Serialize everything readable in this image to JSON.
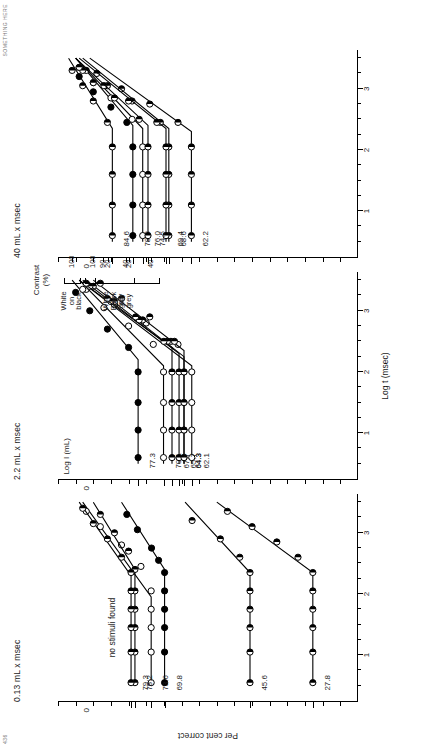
{
  "page": {
    "header_left": "436",
    "header_right": "SOMETHING HERE"
  },
  "figure": {
    "y_axis_title": "Per cent correct",
    "x_axis_title": "Log t (msec)",
    "contrast_axis_title_line1": "Contrast",
    "contrast_axis_title_line2": "(%)",
    "note_no_stimuli": "no stimuli found",
    "x_tick_labels": [
      "1",
      "2",
      "3"
    ],
    "y_tick_labels": [
      "0"
    ],
    "contrast_groups": [
      {
        "label_lines": [
          "Black",
          "on",
          "grey"
        ],
        "ticks": [
          "100",
          "40",
          "20"
        ]
      },
      {
        "label_lines": [
          "White",
          "on",
          "grey"
        ],
        "ticks": [
          "90",
          "40",
          "20"
        ]
      },
      {
        "label_lines": [
          "White",
          "on",
          "black"
        ],
        "ticks": [
          "100"
        ]
      }
    ],
    "panels": [
      {
        "title": "0.13 mL x msec",
        "y_axis_label_text": "Log I (mL)",
        "show_y_axis_title": true,
        "series": [
          {
            "value_label": "69.8",
            "marker": "filled",
            "contrast_group": "black-on-grey",
            "contrast": 100
          },
          {
            "value_label": "45.6",
            "marker": "half",
            "contrast_group": "black-on-grey",
            "contrast": 40
          },
          {
            "value_label": "27.8",
            "marker": "half",
            "contrast_group": "black-on-grey",
            "contrast": 20
          },
          {
            "value_label": "73.6",
            "marker": "open",
            "contrast_group": "white-on-grey",
            "contrast": 90
          },
          {
            "value_label": "78.2",
            "marker": "half",
            "contrast_group": "white-on-grey",
            "contrast": 40
          },
          {
            "value_label": "",
            "marker": "none",
            "contrast_group": "white-on-grey",
            "contrast": 20
          },
          {
            "value_label": "79.3",
            "marker": "half",
            "contrast_group": "white-on-black",
            "contrast": 100
          }
        ]
      },
      {
        "title": "2.2 mL x msec",
        "y_axis_label_text": "Log I (mL)",
        "show_y_axis_title": false,
        "series": [
          {
            "value_label": "77.3",
            "marker": "filled",
            "contrast_group": "black-on-grey",
            "contrast": 100
          },
          {
            "value_label": "62.1",
            "marker": "open",
            "contrast_group": "black-on-grey",
            "contrast": 40
          },
          {
            "value_label": "64.3",
            "marker": "half",
            "contrast_group": "black-on-grey",
            "contrast": 20
          },
          {
            "value_label": "70.1",
            "marker": "open",
            "contrast_group": "white-on-grey",
            "contrast": 90
          },
          {
            "value_label": "65.7",
            "marker": "half",
            "contrast_group": "white-on-grey",
            "contrast": 40
          },
          {
            "value_label": "64.3",
            "marker": "half",
            "contrast_group": "white-on-grey",
            "contrast": 20
          },
          {
            "value_label": "67.7",
            "marker": "half",
            "contrast_group": "white-on-black",
            "contrast": 100
          }
        ]
      },
      {
        "title": "40 mL x msec",
        "y_axis_label_text": "Log I (mL)",
        "show_y_axis_title": false,
        "series": [
          {
            "value_label": "78.8",
            "marker": "filled",
            "contrast_group": "black-on-grey",
            "contrast": 100
          },
          {
            "value_label": "62.2",
            "marker": "half",
            "contrast_group": "black-on-grey",
            "contrast": 40
          },
          {
            "value_label": "68.6",
            "marker": "half",
            "contrast_group": "black-on-grey",
            "contrast": 20
          },
          {
            "value_label": "76.0",
            "marker": "open",
            "contrast_group": "white-on-grey",
            "contrast": 90
          },
          {
            "value_label": "69.4",
            "marker": "half",
            "contrast_group": "white-on-grey",
            "contrast": 40
          },
          {
            "value_label": "74.5",
            "marker": "half",
            "contrast_group": "white-on-grey",
            "contrast": 20
          },
          {
            "value_label": "84.6",
            "marker": "half",
            "contrast_group": "white-on-black",
            "contrast": 100
          }
        ]
      }
    ]
  },
  "chart_data": {
    "type": "scatter",
    "xlabel": "Log t (msec)",
    "ylabel": "Per cent correct",
    "secondary_ylabel": "Contrast (%)",
    "xlim": [
      0.3,
      3.6
    ],
    "grid": false,
    "legend": "none",
    "panels": [
      {
        "name": "0.13 mL x msec",
        "series": [
          {
            "name": "Black on grey 100% (69.8)",
            "marker": "filled",
            "x": [
              0.55,
              1.05,
              1.45,
              1.75,
              2.05,
              2.35,
              2.55,
              2.75,
              3.05,
              3.3
            ],
            "y": [
              69.8,
              69.8,
              69.8,
              69.8,
              69.8,
              69.8,
              71.5,
              73.5,
              77.5,
              80.5
            ],
            "fit": {
              "breakpoint_x": 2.4,
              "plateau_y": 69.8,
              "slope_end_y": 82.0
            }
          },
          {
            "name": "Black on grey 40% (45.6)",
            "marker": "half",
            "x": [
              0.55,
              1.05,
              1.45,
              1.75,
              2.05,
              2.35,
              2.6,
              2.9,
              3.2
            ],
            "y": [
              45.6,
              45.6,
              45.6,
              45.6,
              45.6,
              45.6,
              48.5,
              54.0,
              62.0
            ],
            "fit": {
              "breakpoint_x": 2.35,
              "plateau_y": 45.6,
              "slope_end_y": 64.0
            }
          },
          {
            "name": "Black on grey 20% (27.8)",
            "marker": "half",
            "x": [
              0.55,
              1.05,
              1.45,
              1.75,
              2.05,
              2.35,
              2.6,
              2.85,
              3.1,
              3.35
            ],
            "y": [
              27.8,
              27.8,
              27.8,
              27.8,
              27.8,
              27.8,
              32.0,
              38.0,
              45.0,
              52.0
            ],
            "fit": {
              "breakpoint_x": 2.35,
              "plateau_y": 27.8,
              "slope_end_y": 55.0
            }
          },
          {
            "name": "White on grey 90% (73.6)",
            "marker": "open",
            "x": [
              0.55,
              1.05,
              1.45,
              1.75,
              2.05,
              2.45,
              2.8,
              3.1,
              3.35
            ],
            "y": [
              73.6,
              73.6,
              73.6,
              73.6,
              73.6,
              76.5,
              82.0,
              88.0,
              92.0
            ],
            "fit": {
              "breakpoint_x": 1.95,
              "plateau_y": 73.6,
              "slope_end_y": 93.0
            }
          },
          {
            "name": "White on grey 40% (78.2)",
            "marker": "half",
            "x": [
              0.55,
              1.05,
              1.45,
              1.75,
              2.05,
              2.4,
              2.7,
              3.0,
              3.3
            ],
            "y": [
              78.2,
              78.2,
              78.2,
              78.2,
              78.2,
              78.2,
              80.0,
              84.0,
              88.0
            ],
            "fit": {
              "breakpoint_x": 2.4,
              "plateau_y": 78.2,
              "slope_end_y": 90.0
            }
          },
          {
            "name": "White on grey 20%",
            "marker": "none",
            "x": [],
            "y": [],
            "annotation": "no stimuli found"
          },
          {
            "name": "White on black 100% (79.3)",
            "marker": "half",
            "x": [
              0.55,
              1.05,
              1.45,
              1.75,
              2.05,
              2.35,
              2.6,
              2.9,
              3.15,
              3.4
            ],
            "y": [
              79.3,
              79.3,
              79.3,
              79.3,
              79.3,
              79.3,
              82.0,
              86.0,
              90.0,
              93.0
            ],
            "fit": {
              "breakpoint_x": 2.3,
              "plateau_y": 79.3,
              "slope_end_y": 94.0
            }
          }
        ]
      },
      {
        "name": "2.2 mL x msec",
        "series": [
          {
            "name": "Black on grey 100% (77.3)",
            "marker": "filled",
            "x": [
              0.6,
              1.05,
              1.5,
              2.0,
              2.4,
              2.7,
              3.0,
              3.3
            ],
            "y": [
              77.3,
              77.3,
              77.3,
              77.3,
              80.0,
              86.0,
              91.0,
              95.0
            ],
            "fit": {
              "breakpoint_x": 2.2,
              "plateau_y": 77.3,
              "slope_end_y": 96.0
            }
          },
          {
            "name": "Black on grey 40% (62.1)",
            "marker": "open",
            "x": [
              0.6,
              1.05,
              1.5,
              2.0,
              2.45,
              2.8,
              3.1,
              3.35
            ],
            "y": [
              62.1,
              62.1,
              62.1,
              62.1,
              66.0,
              75.0,
              84.0,
              92.0
            ],
            "fit": {
              "breakpoint_x": 2.1,
              "plateau_y": 62.1,
              "slope_end_y": 94.0
            }
          },
          {
            "name": "Black on grey 20% (64.3)",
            "marker": "half",
            "x": [
              0.6,
              1.05,
              1.5,
              2.0,
              2.5,
              2.85,
              3.15,
              3.4
            ],
            "y": [
              64.3,
              64.3,
              64.3,
              64.3,
              68.0,
              76.0,
              84.0,
              90.0
            ],
            "fit": {
              "breakpoint_x": 2.25,
              "plateau_y": 64.3,
              "slope_end_y": 92.0
            }
          },
          {
            "name": "White on grey 90% (70.1)",
            "marker": "open",
            "x": [
              0.6,
              1.05,
              1.5,
              2.0,
              2.45,
              2.75,
              3.05,
              3.35
            ],
            "y": [
              70.1,
              70.1,
              70.1,
              70.1,
              73.0,
              80.0,
              87.0,
              93.0
            ],
            "fit": {
              "breakpoint_x": 2.1,
              "plateau_y": 70.1,
              "slope_end_y": 94.0
            }
          },
          {
            "name": "White on grey 40% (65.7)",
            "marker": "half",
            "x": [
              0.6,
              1.05,
              1.5,
              2.0,
              2.5,
              2.85,
              3.15,
              3.4
            ],
            "y": [
              65.7,
              65.7,
              65.7,
              65.7,
              69.0,
              77.0,
              85.0,
              91.0
            ],
            "fit": {
              "breakpoint_x": 2.3,
              "plateau_y": 65.7,
              "slope_end_y": 93.0
            }
          },
          {
            "name": "White on grey 20% (64.3)",
            "marker": "half",
            "x": [
              0.6,
              1.05,
              1.5,
              2.0,
              2.5,
              2.9,
              3.2,
              3.45
            ],
            "y": [
              64.3,
              64.3,
              64.3,
              64.3,
              67.0,
              74.0,
              82.0,
              88.0
            ],
            "fit": {
              "breakpoint_x": 2.35,
              "plateau_y": 64.3,
              "slope_end_y": 90.0
            }
          },
          {
            "name": "White on black 100% (67.7)",
            "marker": "half",
            "x": [
              0.6,
              1.05,
              1.5,
              2.0,
              2.5,
              2.9,
              3.2,
              3.45
            ],
            "y": [
              67.7,
              67.7,
              67.7,
              67.7,
              70.0,
              78.0,
              86.0,
              92.0
            ],
            "fit": {
              "breakpoint_x": 2.4,
              "plateau_y": 67.7,
              "slope_end_y": 94.0
            }
          }
        ]
      },
      {
        "name": "40 mL x msec",
        "series": [
          {
            "name": "Black on grey 100% (78.8)",
            "marker": "filled",
            "x": [
              0.6,
              1.1,
              1.6,
              2.05,
              2.45,
              2.7,
              2.95,
              3.2
            ],
            "y": [
              78.8,
              78.8,
              78.8,
              78.8,
              80.5,
              85.0,
              90.0,
              94.0
            ],
            "fit": {
              "breakpoint_x": 2.4,
              "plateau_y": 78.8,
              "slope_end_y": 95.0
            }
          },
          {
            "name": "Black on grey 40% (62.2)",
            "marker": "half",
            "x": [
              0.6,
              1.1,
              1.6,
              2.05,
              2.45,
              2.75,
              3.0,
              3.25
            ],
            "y": [
              62.2,
              62.2,
              62.2,
              62.2,
              66.0,
              74.0,
              82.0,
              89.0
            ],
            "fit": {
              "breakpoint_x": 2.3,
              "plateau_y": 62.2,
              "slope_end_y": 91.0
            }
          },
          {
            "name": "Black on grey 20% (68.6)",
            "marker": "half",
            "x": [
              0.6,
              1.1,
              1.6,
              2.05,
              2.45,
              2.8,
              3.05,
              3.3
            ],
            "y": [
              68.6,
              68.6,
              68.6,
              68.6,
              71.0,
              79.0,
              86.0,
              92.0
            ],
            "fit": {
              "breakpoint_x": 2.35,
              "plateau_y": 68.6,
              "slope_end_y": 93.0
            }
          },
          {
            "name": "White on grey 90% (76.0)",
            "marker": "open",
            "x": [
              0.6,
              1.1,
              1.6,
              2.05,
              2.5,
              2.85,
              3.1,
              3.35
            ],
            "y": [
              76.0,
              76.0,
              76.0,
              76.0,
              79.0,
              85.0,
              90.0,
              94.0
            ],
            "fit": {
              "breakpoint_x": 2.35,
              "plateau_y": 76.0,
              "slope_end_y": 95.0
            }
          },
          {
            "name": "White on grey 40% (69.4)",
            "marker": "half",
            "x": [
              0.6,
              1.1,
              1.6,
              2.05,
              2.45,
              2.8,
              3.05,
              3.3
            ],
            "y": [
              69.4,
              69.4,
              69.4,
              69.4,
              72.0,
              80.0,
              87.0,
              93.0
            ],
            "fit": {
              "breakpoint_x": 2.35,
              "plateau_y": 69.4,
              "slope_end_y": 94.0
            }
          },
          {
            "name": "White on grey 20% (74.5)",
            "marker": "half",
            "x": [
              0.6,
              1.1,
              1.6,
              2.05,
              2.5,
              2.85,
              3.1,
              3.35
            ],
            "y": [
              74.5,
              74.5,
              74.5,
              74.5,
              77.0,
              84.0,
              90.0,
              94.0
            ],
            "fit": {
              "breakpoint_x": 2.4,
              "plateau_y": 74.5,
              "slope_end_y": 95.0
            }
          },
          {
            "name": "White on black 100% (84.6)",
            "marker": "half",
            "x": [
              0.6,
              1.1,
              1.6,
              2.05,
              2.45,
              2.8,
              3.05,
              3.3
            ],
            "y": [
              84.6,
              84.6,
              84.6,
              84.6,
              86.0,
              90.0,
              93.0,
              96.0
            ],
            "fit": {
              "breakpoint_x": 2.35,
              "plateau_y": 84.6,
              "slope_end_y": 97.0
            }
          }
        ]
      }
    ]
  }
}
